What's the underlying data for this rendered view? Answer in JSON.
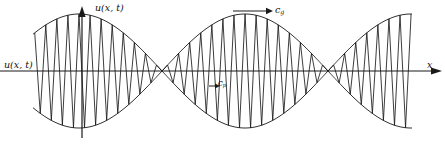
{
  "figure": {
    "background_color": "#ffffff",
    "stroke_color": "#1a1a1a",
    "width": 445,
    "height": 146
  },
  "labels": {
    "u_axis": "u(x, t)",
    "u_left": "u(x, t)",
    "x_axis": "x",
    "group_velocity": "c",
    "group_velocity_sub": "g",
    "phase_velocity": "c",
    "phase_velocity_sub": "p"
  },
  "axes": {
    "x_axis_label": "x",
    "y_axis_label": "u(x, t)",
    "origin_x": 82,
    "baseline_y": 71,
    "x_axis_start": 0,
    "x_axis_end": 441,
    "y_axis_top": 8,
    "y_axis_bottom": 138
  },
  "arrows": {
    "group_velocity_arrow": {
      "x1": 233,
      "y1": 11,
      "x2": 272,
      "y2": 11,
      "direction": "right",
      "length": 39
    },
    "phase_velocity_arrow": {
      "x1": 209,
      "y1": 86,
      "x2": 219,
      "y2": 86,
      "direction": "right",
      "length": 10
    }
  },
  "chart_data": {
    "type": "line",
    "title": "",
    "xlabel": "x",
    "ylabel": "u(x, t)",
    "curves": [
      {
        "name": "upper-envelope",
        "role": "envelope",
        "amplitude": 57,
        "envelope_half_period_px": 166
      },
      {
        "name": "lower-envelope",
        "role": "envelope",
        "amplitude": -57,
        "envelope_half_period_px": 166
      },
      {
        "name": "carrier",
        "role": "modulated-carrier",
        "carrier_period_px": 11.07
      }
    ],
    "wave_start_x": 33,
    "wave_end_x": 412,
    "envelope_amplitude_px": 57,
    "envelope_half_period_px": 166,
    "carrier_period_px": 11.07,
    "node_positions_x": [
      162,
      328
    ],
    "antinode_positions_x": [
      79,
      245,
      411
    ],
    "baseline_y": 71,
    "grid": false,
    "legend": "none"
  }
}
